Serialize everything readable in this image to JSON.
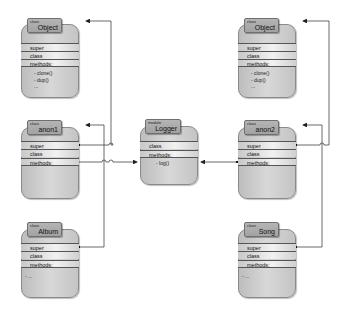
{
  "diagram": {
    "left_column": [
      {
        "id": "object_left",
        "kind": "class",
        "name": "Object",
        "rows": [
          "super",
          "class",
          "methods:"
        ],
        "methods": [
          "- clone()",
          "- dup()",
          "..."
        ]
      },
      {
        "id": "anon1",
        "kind": "class",
        "name": "anon1",
        "rows": [
          "super",
          "class",
          "methods:"
        ],
        "methods": []
      },
      {
        "id": "album",
        "kind": "class",
        "name": "Album",
        "rows": [
          "super",
          "class",
          "methods:"
        ],
        "methods": [
          "- ..."
        ]
      }
    ],
    "center": {
      "id": "logger",
      "kind": "module",
      "name": "Logger",
      "rows": [
        "class",
        "methods:"
      ],
      "methods": [
        "- log()"
      ]
    },
    "right_column": [
      {
        "id": "object_right",
        "kind": "class",
        "name": "Object",
        "rows": [
          "super",
          "class",
          "methods:"
        ],
        "methods": [
          "- clone()",
          "- dup()",
          "..."
        ]
      },
      {
        "id": "anon2",
        "kind": "class",
        "name": "anon2",
        "rows": [
          "super",
          "class",
          "methods:"
        ],
        "methods": []
      },
      {
        "id": "song",
        "kind": "class",
        "name": "Song",
        "rows": [
          "super",
          "class",
          "methods:"
        ],
        "methods": [
          "- ..."
        ]
      }
    ],
    "connections": [
      {
        "from": "anon1.super",
        "to": "object_left"
      },
      {
        "from": "album.super",
        "to": "anon1"
      },
      {
        "from": "anon1.methods",
        "to": "logger"
      },
      {
        "from": "anon2.super",
        "to": "object_right"
      },
      {
        "from": "song.super",
        "to": "anon2"
      },
      {
        "from": "anon2.methods",
        "to": "logger"
      }
    ],
    "colors": {
      "box": "#c8c8c8",
      "tab": "#a8a8a8",
      "line": "#444444"
    }
  }
}
